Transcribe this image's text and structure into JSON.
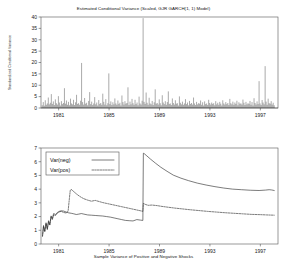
{
  "chart_data": [
    {
      "type": "line",
      "id": "conditional-variance",
      "title": "Estimated Conditional Variance (Scaled, GJR GARCH(1, 1) Model)",
      "xlabel": "",
      "ylabel": "Standardized Conditional Variance",
      "grid": false,
      "legend": "none",
      "xlim": [
        1979.6,
        1998.4
      ],
      "ylim": [
        0,
        40
      ],
      "yticks": [
        0,
        5,
        10,
        15,
        20,
        25,
        30,
        35,
        40
      ],
      "ytick_labels": [
        "0",
        "5",
        "10",
        "15",
        "20",
        "25",
        "30",
        "35",
        "40"
      ],
      "xticks": [
        1981,
        1985,
        1989,
        1993,
        1997
      ],
      "xtick_labels": [
        "1981",
        "1985",
        "1989",
        "1993",
        "1997"
      ],
      "series": [
        {
          "name": "Standardized Conditional Variance",
          "style": "impulse-spikes",
          "x": [
            1979.7,
            1979.78,
            1979.86,
            1979.94,
            1980.02,
            1980.1,
            1980.18,
            1980.26,
            1980.34,
            1980.42,
            1980.5,
            1980.58,
            1980.66,
            1980.74,
            1980.82,
            1980.9,
            1980.98,
            1981.06,
            1981.14,
            1981.22,
            1981.3,
            1981.38,
            1981.46,
            1981.54,
            1981.62,
            1981.7,
            1981.78,
            1981.86,
            1981.94,
            1982.02,
            1982.1,
            1982.18,
            1982.26,
            1982.34,
            1982.42,
            1982.5,
            1982.58,
            1982.66,
            1982.74,
            1982.82,
            1982.9,
            1982.98,
            1983.06,
            1983.14,
            1983.22,
            1983.3,
            1983.38,
            1983.46,
            1983.54,
            1983.62,
            1983.7,
            1983.78,
            1983.86,
            1983.94,
            1984.02,
            1984.1,
            1984.18,
            1984.26,
            1984.34,
            1984.42,
            1984.5,
            1984.58,
            1984.66,
            1984.74,
            1984.82,
            1984.9,
            1984.98,
            1985.06,
            1985.14,
            1985.22,
            1985.3,
            1985.38,
            1985.46,
            1985.54,
            1985.62,
            1985.7,
            1985.78,
            1985.86,
            1985.94,
            1986.02,
            1986.1,
            1986.18,
            1986.26,
            1986.34,
            1986.42,
            1986.5,
            1986.58,
            1986.66,
            1986.74,
            1986.82,
            1986.9,
            1986.98,
            1987.06,
            1987.14,
            1987.22,
            1987.3,
            1987.38,
            1987.46,
            1987.54,
            1987.62,
            1987.7,
            1987.78,
            1987.86,
            1987.94,
            1988.02,
            1988.1,
            1988.18,
            1988.26,
            1988.34,
            1988.42,
            1988.5,
            1988.58,
            1988.66,
            1988.74,
            1988.82,
            1988.9,
            1988.98,
            1989.06,
            1989.14,
            1989.22,
            1989.3,
            1989.38,
            1989.46,
            1989.54,
            1989.62,
            1989.7,
            1989.78,
            1989.86,
            1989.94,
            1990.02,
            1990.1,
            1990.18,
            1990.26,
            1990.34,
            1990.42,
            1990.5,
            1990.58,
            1990.66,
            1990.74,
            1990.82,
            1990.9,
            1990.98,
            1991.06,
            1991.14,
            1991.22,
            1991.3,
            1991.38,
            1991.46,
            1991.54,
            1991.62,
            1991.7,
            1991.78,
            1991.86,
            1991.94,
            1992.02,
            1992.1,
            1992.18,
            1992.26,
            1992.34,
            1992.42,
            1992.5,
            1992.58,
            1992.66,
            1992.74,
            1992.82,
            1992.9,
            1992.98,
            1993.06,
            1993.14,
            1993.22,
            1993.3,
            1993.38,
            1993.46,
            1993.54,
            1993.62,
            1993.7,
            1993.78,
            1993.86,
            1993.94,
            1994.02,
            1994.1,
            1994.18,
            1994.26,
            1994.34,
            1994.42,
            1994.5,
            1994.58,
            1994.66,
            1994.74,
            1994.82,
            1994.9,
            1994.98,
            1995.06,
            1995.14,
            1995.22,
            1995.3,
            1995.38,
            1995.46,
            1995.54,
            1995.62,
            1995.7,
            1995.78,
            1995.86,
            1995.94,
            1996.02,
            1996.1,
            1996.18,
            1996.26,
            1996.34,
            1996.42,
            1996.5,
            1996.58,
            1996.66,
            1996.74,
            1996.82,
            1996.9,
            1996.98,
            1997.06,
            1997.14,
            1997.22,
            1997.3,
            1997.38,
            1997.46,
            1997.54,
            1997.62,
            1997.7,
            1997.78,
            1997.86,
            1997.94,
            1998.02,
            1998.1
          ],
          "values": [
            1.2,
            2.6,
            1.0,
            3.4,
            1.4,
            2.0,
            4.6,
            1.6,
            2.3,
            6.1,
            1.8,
            2.9,
            1.3,
            3.8,
            2.1,
            1.5,
            5.2,
            2.4,
            1.1,
            3.0,
            1.7,
            2.2,
            8.7,
            1.9,
            3.3,
            1.4,
            2.7,
            1.2,
            4.1,
            2.0,
            1.6,
            3.6,
            1.3,
            2.5,
            5.8,
            1.8,
            2.1,
            1.4,
            3.2,
            19.8,
            2.6,
            1.5,
            4.4,
            1.9,
            2.3,
            1.2,
            3.1,
            7.0,
            1.7,
            2.8,
            1.3,
            2.0,
            4.8,
            1.6,
            2.4,
            1.1,
            3.5,
            1.8,
            2.2,
            1.4,
            6.3,
            2.7,
            1.5,
            3.9,
            1.2,
            2.1,
            15.2,
            1.7,
            2.9,
            1.3,
            2.5,
            1.6,
            4.2,
            2.0,
            1.4,
            3.3,
            1.8,
            2.3,
            1.1,
            5.5,
            2.6,
            1.5,
            3.0,
            1.9,
            2.2,
            9.1,
            1.3,
            2.8,
            1.6,
            4.0,
            2.1,
            1.4,
            3.6,
            1.7,
            2.4,
            1.2,
            5.0,
            2.0,
            1.5,
            3.2,
            39.5,
            2.7,
            1.8,
            6.8,
            2.3,
            1.4,
            4.5,
            2.0,
            1.6,
            3.1,
            1.3,
            2.5,
            8.2,
            1.9,
            2.2,
            1.5,
            3.8,
            2.1,
            1.2,
            5.6,
            2.4,
            1.7,
            3.0,
            1.4,
            2.6,
            7.3,
            1.8,
            2.0,
            1.3,
            4.2,
            2.2,
            1.5,
            3.4,
            1.9,
            2.1,
            1.1,
            5.1,
            2.3,
            1.6,
            2.8,
            1.4,
            2.0,
            3.9,
            1.7,
            2.4,
            1.2,
            3.1,
            1.8,
            2.2,
            1.5,
            4.6,
            2.0,
            1.3,
            2.7,
            1.6,
            2.1,
            1.9,
            3.3,
            1.4,
            2.5,
            1.1,
            2.9,
            1.7,
            2.0,
            1.3,
            3.6,
            2.2,
            1.5,
            2.4,
            1.8,
            2.1,
            1.2,
            3.0,
            1.6,
            2.3,
            1.4,
            2.7,
            1.9,
            1.1,
            3.4,
            2.0,
            1.5,
            2.6,
            1.7,
            2.2,
            1.3,
            4.0,
            2.1,
            1.6,
            2.8,
            1.4,
            2.4,
            1.8,
            3.2,
            1.2,
            2.5,
            1.9,
            2.0,
            1.5,
            3.7,
            2.3,
            1.3,
            2.7,
            1.6,
            2.1,
            1.8,
            3.1,
            1.4,
            2.6,
            1.1,
            4.3,
            2.2,
            1.5,
            2.9,
            1.7,
            11.8,
            2.0,
            1.3,
            3.5,
            2.4,
            1.6,
            18.4,
            2.8,
            1.4,
            4.1,
            2.1,
            1.9,
            3.0,
            1.5,
            2.3,
            1.2,
            3.8,
            2.0,
            1.6,
            2.5
          ]
        }
      ]
    },
    {
      "type": "line",
      "id": "sample-variance-shocks",
      "title": "Sample Variance of Positive and Negative Shocks",
      "xlabel": "",
      "ylabel": "",
      "grid": false,
      "legend": "top-left",
      "xlim": [
        1979.6,
        1998.4
      ],
      "ylim": [
        0,
        7
      ],
      "yticks": [
        0,
        1,
        2,
        3,
        4,
        5,
        6,
        7
      ],
      "ytick_labels": [
        "0",
        "1",
        "2",
        "3",
        "4",
        "5",
        "6",
        "7"
      ],
      "xticks": [
        1981,
        1985,
        1989,
        1993,
        1997
      ],
      "xtick_labels": [
        "1981",
        "1985",
        "1989",
        "1993",
        "1997"
      ],
      "series": [
        {
          "name": "Var(neg)",
          "style": "solid",
          "x": [
            1979.72,
            1979.8,
            1979.9,
            1980.0,
            1980.1,
            1980.2,
            1980.3,
            1980.4,
            1980.5,
            1980.6,
            1980.75,
            1980.9,
            1981.05,
            1981.2,
            1981.4,
            1981.6,
            1981.8,
            1982.0,
            1982.2,
            1982.4,
            1982.6,
            1982.8,
            1983.0,
            1983.3,
            1983.6,
            1983.9,
            1984.2,
            1984.5,
            1984.8,
            1985.1,
            1985.4,
            1985.7,
            1986.0,
            1986.3,
            1986.6,
            1986.9,
            1987.2,
            1987.5,
            1987.68,
            1987.72,
            1987.8,
            1988.0,
            1988.3,
            1988.7,
            1989.1,
            1989.6,
            1990.1,
            1990.7,
            1991.3,
            1992.0,
            1992.7,
            1993.4,
            1994.1,
            1994.8,
            1995.5,
            1996.2,
            1996.9,
            1997.4,
            1997.7,
            1997.9,
            1998.1
          ],
          "values": [
            0.62,
            1.35,
            0.95,
            1.55,
            1.12,
            1.7,
            1.42,
            2.05,
            1.85,
            2.22,
            2.15,
            2.3,
            2.38,
            2.42,
            2.4,
            2.33,
            2.27,
            2.24,
            2.2,
            2.15,
            2.18,
            2.22,
            2.18,
            2.12,
            2.1,
            2.08,
            2.06,
            2.04,
            2.0,
            1.96,
            1.9,
            1.84,
            1.78,
            1.72,
            1.7,
            1.68,
            1.78,
            1.74,
            1.72,
            6.62,
            6.58,
            6.42,
            6.18,
            5.88,
            5.6,
            5.3,
            5.02,
            4.8,
            4.62,
            4.44,
            4.3,
            4.18,
            4.08,
            4.0,
            3.96,
            3.92,
            3.9,
            3.93,
            3.96,
            3.94,
            3.9
          ]
        },
        {
          "name": "Var(pos)",
          "style": "dashed",
          "x": [
            1979.72,
            1979.8,
            1979.9,
            1980.0,
            1980.1,
            1980.2,
            1980.3,
            1980.4,
            1980.5,
            1980.6,
            1980.75,
            1980.9,
            1981.05,
            1981.2,
            1981.4,
            1981.6,
            1981.75,
            1981.85,
            1981.92,
            1982.0,
            1982.2,
            1982.4,
            1982.6,
            1982.8,
            1983.0,
            1983.3,
            1983.6,
            1983.9,
            1984.2,
            1984.5,
            1984.8,
            1985.1,
            1985.4,
            1985.7,
            1986.0,
            1986.3,
            1986.6,
            1986.9,
            1987.2,
            1987.5,
            1987.68,
            1987.72,
            1987.9,
            1988.1,
            1988.4,
            1988.8,
            1989.2,
            1989.7,
            1990.2,
            1990.8,
            1991.4,
            1992.1,
            1992.8,
            1993.5,
            1994.2,
            1994.9,
            1995.6,
            1996.3,
            1997.0,
            1997.5,
            1997.8,
            1998.1
          ],
          "values": [
            0.55,
            1.28,
            0.88,
            1.48,
            1.05,
            1.62,
            1.38,
            1.98,
            1.78,
            2.12,
            2.08,
            2.25,
            2.34,
            2.38,
            2.3,
            2.26,
            2.4,
            3.3,
            3.92,
            3.98,
            3.82,
            3.66,
            3.52,
            3.4,
            3.3,
            3.2,
            3.12,
            3.18,
            3.1,
            3.02,
            2.96,
            2.9,
            2.84,
            2.78,
            2.72,
            2.66,
            2.6,
            2.54,
            2.48,
            2.42,
            2.38,
            2.96,
            2.88,
            2.82,
            2.84,
            2.8,
            2.74,
            2.68,
            2.62,
            2.56,
            2.5,
            2.44,
            2.38,
            2.33,
            2.28,
            2.24,
            2.2,
            2.16,
            2.14,
            2.12,
            2.11,
            2.1
          ]
        }
      ]
    }
  ]
}
